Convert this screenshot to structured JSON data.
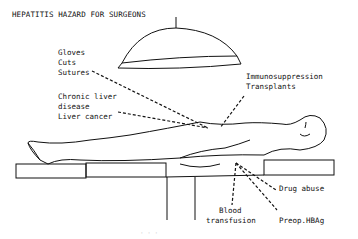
{
  "title": "HEPATITIS HAZARD FOR SURGEONS",
  "labels": {
    "gloves": "Gloves",
    "cuts": "Cuts",
    "sutures": "Sutures",
    "chronic1": "Chronic liver",
    "chronic2": "disease",
    "liver_cancer": "Liver cancer",
    "immuno": "Immunosuppression",
    "transplants": "Transplants",
    "drug_abuse": "Drug abuse",
    "blood1": "Blood",
    "blood2": "transfusion",
    "preop": "Preop.HBAg"
  },
  "caption": "· · ·"
}
